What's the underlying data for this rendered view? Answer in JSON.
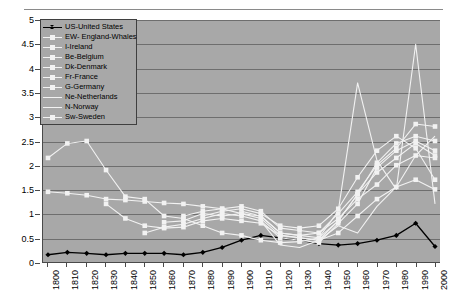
{
  "chart_data": {
    "type": "line",
    "title": "",
    "xlabel": "",
    "ylabel": "",
    "ylim": [
      0,
      5
    ],
    "ytick_step": 0.5,
    "yticks": [
      "5",
      "4.5",
      "4",
      "3.5",
      "3",
      "2.5",
      "2",
      "1.5",
      "1",
      "0.5",
      "0"
    ],
    "grid": true,
    "legend_position": "top-left-inside",
    "plot_background": "#a8a8a8",
    "gridline_color": "#6e6e6e",
    "axis_color": "#4a4a4a",
    "categories": [
      "1800",
      "1810",
      "1820",
      "1830",
      "1840",
      "1850",
      "1860",
      "1870",
      "1880",
      "1890",
      "1900",
      "1910",
      "1920",
      "1930",
      "1940",
      "1950",
      "1960",
      "1970",
      "1980",
      "1990",
      "2000"
    ],
    "series": [
      {
        "name": "US-United States",
        "code": "US",
        "color": "#000000",
        "marker": "diamond",
        "values": [
          0.15,
          0.2,
          0.18,
          0.15,
          0.18,
          0.18,
          0.18,
          0.15,
          0.2,
          0.3,
          0.45,
          0.55,
          0.5,
          0.45,
          0.38,
          0.35,
          0.38,
          0.45,
          0.55,
          0.8,
          0.32
        ]
      },
      {
        "name": "EW- England-Whales",
        "code": "EW",
        "color": "#f2f2f2",
        "marker": "square",
        "values": [
          1.45,
          1.42,
          1.38,
          1.3,
          1.28,
          1.25,
          1.22,
          1.2,
          1.15,
          1.1,
          1.0,
          0.95,
          0.6,
          0.55,
          0.6,
          0.9,
          1.3,
          1.6,
          2.0,
          2.2,
          2.15
        ]
      },
      {
        "name": "I-Ireland",
        "code": "I",
        "color": "#f2f2f2",
        "marker": "square",
        "values": [
          null,
          null,
          null,
          1.2,
          0.9,
          0.75,
          0.7,
          0.72,
          0.85,
          0.9,
          0.85,
          0.8,
          0.55,
          0.5,
          0.45,
          0.6,
          0.95,
          1.3,
          1.55,
          1.7,
          1.5
        ]
      },
      {
        "name": "Be-Belgium",
        "code": "Be",
        "color": "#f2f2f2",
        "marker": "square",
        "values": [
          null,
          null,
          null,
          null,
          null,
          0.6,
          0.72,
          0.78,
          0.9,
          1.0,
          0.95,
          0.85,
          0.5,
          0.45,
          0.4,
          0.8,
          1.2,
          1.95,
          2.3,
          2.5,
          2.3
        ]
      },
      {
        "name": "Dk-Denmark",
        "code": "Dk",
        "color": "#f2f2f2",
        "marker": "square",
        "values": [
          null,
          null,
          null,
          null,
          null,
          null,
          null,
          null,
          0.95,
          1.05,
          1.1,
          1.0,
          0.75,
          0.7,
          0.75,
          1.1,
          1.75,
          2.3,
          2.6,
          2.35,
          1.7
        ]
      },
      {
        "name": "Fr-France",
        "code": "Fr",
        "color": "#f2f2f2",
        "marker": "square",
        "values": [
          null,
          null,
          null,
          null,
          null,
          null,
          0.82,
          0.85,
          1.0,
          0.95,
          1.0,
          0.9,
          0.55,
          0.5,
          0.45,
          0.85,
          1.4,
          2.05,
          2.45,
          2.6,
          2.5
        ]
      },
      {
        "name": "G-Germany",
        "code": "G",
        "color": "#f2f2f2",
        "marker": "square",
        "values": [
          null,
          null,
          null,
          null,
          null,
          null,
          null,
          0.95,
          1.05,
          1.1,
          1.15,
          1.05,
          0.7,
          0.65,
          0.6,
          1.0,
          1.45,
          2.0,
          2.35,
          2.85,
          2.8
        ]
      },
      {
        "name": "Ne-Netherlands",
        "code": "Ne",
        "color": "#f2f2f2",
        "marker": "none",
        "values": [
          null,
          null,
          null,
          null,
          null,
          null,
          null,
          null,
          null,
          null,
          1.05,
          0.95,
          0.6,
          0.55,
          0.5,
          1.05,
          3.7,
          2.1,
          1.5,
          4.5,
          1.2
        ]
      },
      {
        "name": "N-Norway",
        "code": "N",
        "color": "#f2f2f2",
        "marker": "none",
        "values": [
          null,
          null,
          null,
          null,
          null,
          null,
          null,
          null,
          null,
          null,
          null,
          0.85,
          0.35,
          0.3,
          0.45,
          0.75,
          0.6,
          1.15,
          1.55,
          2.2,
          2.6
        ]
      },
      {
        "name": "Sw-Sweden",
        "code": "Sw",
        "color": "#f2f2f2",
        "marker": "square",
        "values": [
          2.15,
          2.45,
          2.5,
          1.9,
          1.35,
          1.3,
          0.95,
          0.9,
          0.75,
          0.6,
          0.55,
          0.45,
          0.4,
          0.42,
          0.5,
          0.85,
          1.4,
          1.85,
          2.15,
          2.45,
          2.2
        ]
      }
    ]
  },
  "legend": {
    "items": [
      {
        "label": "US-United States"
      },
      {
        "label": "EW- England-Whales"
      },
      {
        "label": "I-Ireland"
      },
      {
        "label": "Be-Belgium"
      },
      {
        "label": "Dk-Denmark"
      },
      {
        "label": "Fr-France"
      },
      {
        "label": "G-Germany"
      },
      {
        "label": "Ne-Netherlands"
      },
      {
        "label": "N-Norway"
      },
      {
        "label": "Sw-Sweden"
      }
    ]
  }
}
